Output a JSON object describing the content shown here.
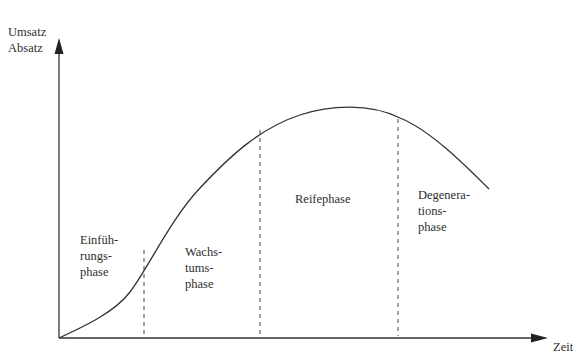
{
  "diagram": {
    "y_axis_label_line1": "Umsatz",
    "y_axis_label_line2": "Absatz",
    "x_axis_label": "Zeit",
    "phases": [
      {
        "line1": "Einfüh-",
        "line2": "rungs-",
        "line3": "phase"
      },
      {
        "line1": "Wachs-",
        "line2": "tums-",
        "line3": "phase"
      },
      {
        "line1": "Reifephase"
      },
      {
        "line1": "Degenera-",
        "line2": "tions-",
        "line3": "phase"
      }
    ],
    "colors": {
      "line": "#333333",
      "text": "#2e2e2e",
      "background": "#ffffff"
    }
  }
}
